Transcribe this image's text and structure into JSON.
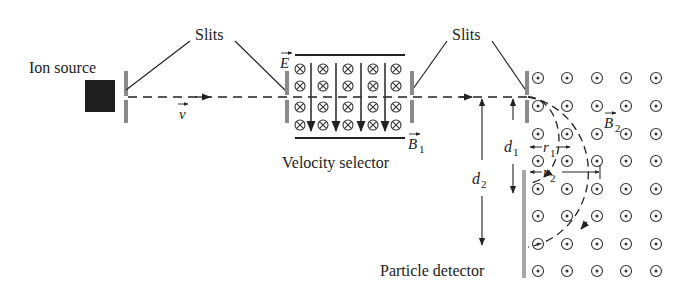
{
  "labels": {
    "ion_source": "Ion source",
    "slits_left": "Slits",
    "slits_right": "Slits",
    "velocity_selector": "Velocity selector",
    "particle_detector": "Particle detector"
  },
  "symbols": {
    "velocity": "v",
    "electric_field": "E",
    "magnetic_field_1": "B",
    "magnetic_field_1_sub": "1",
    "magnetic_field_2": "B",
    "magnetic_field_2_sub": "2",
    "r1": "r",
    "r1_sub": "1",
    "r2": "r",
    "r2_sub": "2",
    "d1": "d",
    "d1_sub": "1",
    "d2": "d",
    "d2_sub": "2"
  },
  "field_markers": {
    "selector_into_page_rows": 4,
    "selector_into_page_cols": 5,
    "region2_out_of_page_rows": 8,
    "region2_out_of_page_cols": 5
  },
  "colors": {
    "ink": "#222222",
    "slit_gray": "#8a8a8a",
    "detector_gray": "#a8a8a8",
    "source": "#1e1e1e"
  }
}
